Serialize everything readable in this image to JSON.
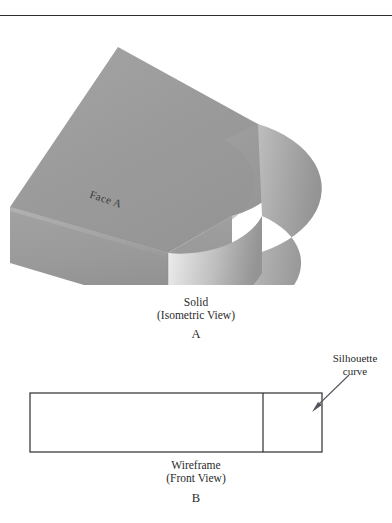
{
  "figure": {
    "top_rule_present": true
  },
  "solid": {
    "face_label": "Face A",
    "caption_line1": "Solid",
    "caption_line2": "(Isometric View)",
    "caption_letter": "A",
    "colors": {
      "top_face": "#9a9a9a",
      "front_face": "#9d9d9d",
      "left_end_face": "#8e8e8e",
      "cylinder_light": "#e2e2e2",
      "cylinder_mid": "#c4c4c4",
      "cylinder_dark": "#a0a0a0",
      "top_cap_light": "#b5b5b5",
      "outline": "#8a8a8a"
    }
  },
  "wireframe": {
    "face_label": "Face A",
    "caption_line1": "Wireframe",
    "caption_line2": "(Front View)",
    "caption_letter": "B",
    "annotation_line1": "Silhouette",
    "annotation_line2": "curve",
    "colors": {
      "stroke": "#2e2e2e",
      "fill": "#ffffff",
      "arrow": "#55555f"
    }
  }
}
